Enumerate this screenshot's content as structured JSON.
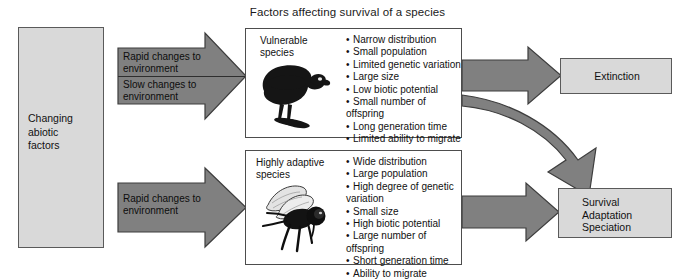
{
  "title": "Factors affecting survival of a species",
  "source": {
    "label": "Changing\nabiotic\nfactors",
    "line1": "Changing",
    "line2": "abiotic",
    "line3": "factors"
  },
  "arrows": {
    "rapid_top": {
      "line1": "Rapid changes to",
      "line2": "environment"
    },
    "slow": {
      "line1": "Slow changes to",
      "line2": "environment"
    },
    "rapid_bottom": {
      "line1": "Rapid changes to",
      "line2": "environment"
    }
  },
  "panels": {
    "vulnerable": {
      "name_line1": "Vulnerable",
      "name_line2": "species",
      "image": "vulture-silhouette",
      "traits": [
        "Narrow distribution",
        "Small population",
        "Limited genetic variation",
        "Large size",
        "Low biotic potential",
        "Small number of offspring",
        "Long generation time",
        "Limited ability to migrate"
      ]
    },
    "adaptive": {
      "name_line1": "Highly adaptive",
      "name_line2": "species",
      "image": "fly-silhouette",
      "traits": [
        "Wide distribution",
        "Large population",
        "High degree of genetic variation",
        "Small size",
        "High biotic potential",
        "Large number of offspring",
        "Short generation time",
        "Ability to migrate"
      ]
    }
  },
  "outcomes": {
    "extinction": {
      "label": "Extinction"
    },
    "survival": {
      "line1": "Survival",
      "line2": "Adaptation",
      "line3": "Speciation"
    }
  },
  "colors": {
    "box_fill": "#d9d9d9",
    "box_border": "#5a5a5a",
    "arrow_fill": "#808080",
    "arrow_border": "#3d3d3d",
    "panel_border": "#4d4d4d",
    "text": "#111111",
    "background": "#ffffff"
  }
}
